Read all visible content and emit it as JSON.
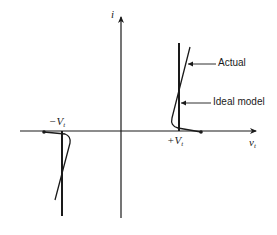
{
  "diagram": {
    "type": "diode i-v characteristic (bidirectional / tunnel-like threshold)",
    "axes": {
      "y_label": "i",
      "x_label_main": "v",
      "x_label_sub": "t"
    },
    "threshold_labels": {
      "negative_main": "−V",
      "negative_sub": "t",
      "positive_main": "+V",
      "positive_sub": "t"
    },
    "annotations": {
      "actual": "Actual",
      "ideal": "Ideal model"
    },
    "colors": {
      "stroke": "#1a1a1a",
      "background": "#ffffff"
    }
  }
}
